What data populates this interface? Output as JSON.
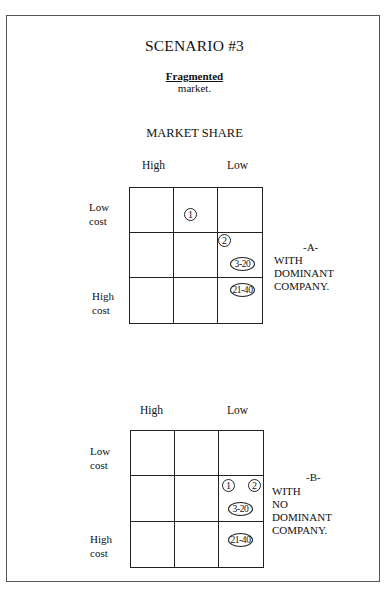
{
  "document": {
    "title": "SCENARIO #3",
    "subtitle_underlined": "Fragmented",
    "subtitle_rest": "market.",
    "section_title": "MARKET SHARE"
  },
  "matrix_a": {
    "col_labels": {
      "high": "High",
      "low": "Low"
    },
    "row_labels": {
      "low_line1": "Low",
      "low_line2": "cost",
      "high_line1": "High",
      "high_line2": "cost"
    },
    "markers": [
      {
        "label": "1",
        "row": 1,
        "col": 2
      },
      {
        "label": "2",
        "row": 2,
        "col": 3
      },
      {
        "label": "3-20",
        "row": 2,
        "col": 3
      },
      {
        "label": "21-40",
        "row": 3,
        "col": 3
      }
    ],
    "caption": {
      "letter": "-A-",
      "line1": "WITH",
      "line2": "DOMINANT",
      "line3": "COMPANY."
    }
  },
  "matrix_b": {
    "col_labels": {
      "high": "High",
      "low": "Low"
    },
    "row_labels": {
      "low_line1": "Low",
      "low_line2": "cost",
      "high_line1": "High",
      "high_line2": "cost"
    },
    "markers": [
      {
        "label": "1",
        "row": 2,
        "col": 3
      },
      {
        "label": "2",
        "row": 2,
        "col": 3
      },
      {
        "label": "3-20",
        "row": 2,
        "col": 3
      },
      {
        "label": "21-40",
        "row": 3,
        "col": 3
      }
    ],
    "caption": {
      "letter": "-B-",
      "line1": "WITH",
      "line2": "NO",
      "line3": "DOMINANT",
      "line4": "COMPANY."
    }
  }
}
